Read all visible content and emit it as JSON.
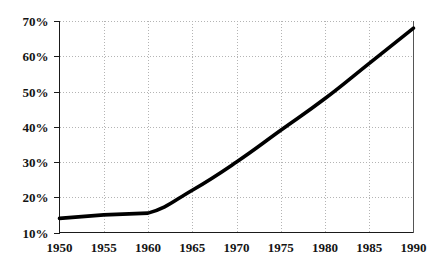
{
  "chart_data": {
    "type": "line",
    "title": "",
    "subtitle": "",
    "xlabel": "",
    "ylabel": "",
    "x": [
      1950,
      1955,
      1960,
      1965,
      1970,
      1975,
      1980,
      1985,
      1990
    ],
    "categories": [
      "1950",
      "1955",
      "1960",
      "1965",
      "1970",
      "1975",
      "1980",
      "1985",
      "1990"
    ],
    "values": [
      14,
      15,
      15.5,
      22,
      30,
      39,
      48,
      58,
      68
    ],
    "series": [
      {
        "name": "",
        "values": [
          14,
          15,
          15.5,
          22,
          30,
          39,
          48,
          58,
          68
        ]
      }
    ],
    "xlim": [
      1950,
      1990
    ],
    "ylim": [
      10,
      70
    ],
    "x_tick_labels": [
      "1950",
      "1955",
      "1960",
      "1965",
      "1970",
      "1975",
      "1980",
      "1985",
      "1990"
    ],
    "y_tick_labels": [
      "10%",
      "20%",
      "30%",
      "40%",
      "50%",
      "60%",
      "70%"
    ],
    "y_tick_values": [
      10,
      20,
      30,
      40,
      50,
      60,
      70
    ],
    "grid": true,
    "grid_style": "dotted",
    "legend": false,
    "legend_position": "none",
    "annotations": [],
    "line_color": "#000000",
    "grid_color": "#b4b4b4",
    "axis_color": "#1a1a1a",
    "background_color": "#ffffff"
  }
}
